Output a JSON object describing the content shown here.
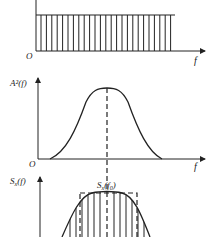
{
  "panels": {
    "top": {
      "origin_label": "O",
      "x_axis_label": "f",
      "description": "flat broadband (white noise) spectrum with vertical hatching"
    },
    "middle": {
      "y_axis_label": "A²(f)",
      "origin_label": "O",
      "x_axis_label": "f",
      "description": "bandpass filter squared amplitude response, bell-shaped, centered at f0"
    },
    "bottom": {
      "y_axis_label": "Sₓ(f)",
      "y_axis_label_base": "S",
      "y_axis_label_sub": "x",
      "y_axis_label_arg": "(f)",
      "peak_label_base": "S",
      "peak_label_sub": "x",
      "peak_label_arg_open": "(f",
      "peak_label_arg_sub": "0",
      "peak_label_arg_close": ")",
      "description": "filtered output spectrum, hatched bell curve within dashed equivalent rectangle"
    }
  },
  "colors": {
    "stroke": "#222222",
    "background": "#ffffff"
  }
}
